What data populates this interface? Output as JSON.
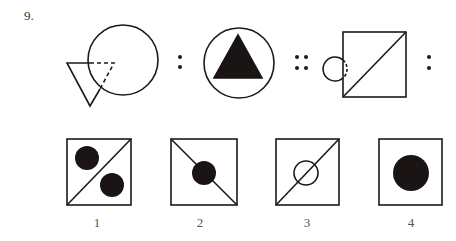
{
  "question": {
    "number": "9."
  },
  "analogy": {
    "separators": [
      ":",
      "::",
      ":"
    ]
  },
  "options": [
    {
      "label": "1"
    },
    {
      "label": "2"
    },
    {
      "label": "3"
    },
    {
      "label": "4"
    }
  ],
  "colors": {
    "stroke": "#1a1a1a",
    "fill": "#1a1414",
    "background": "#ffffff"
  }
}
